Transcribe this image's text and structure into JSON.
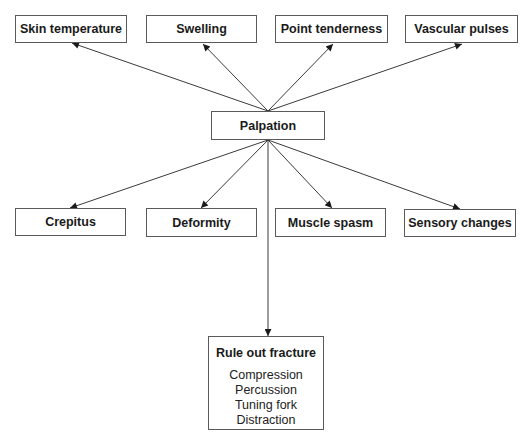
{
  "diagram": {
    "center": {
      "label": "Palpation",
      "box": [
        211,
        111,
        114,
        29
      ]
    },
    "top_nodes": [
      {
        "label": "Skin temperature",
        "box": [
          15,
          15,
          112,
          28
        ]
      },
      {
        "label": "Swelling",
        "box": [
          146,
          15,
          111,
          28
        ]
      },
      {
        "label": "Point tenderness",
        "box": [
          275,
          15,
          113,
          28
        ]
      },
      {
        "label": "Vascular pulses",
        "box": [
          405,
          15,
          113,
          28
        ]
      }
    ],
    "bottom_nodes": [
      {
        "label": "Crepitus",
        "box": [
          15,
          208,
          111,
          28
        ]
      },
      {
        "label": "Deformity",
        "box": [
          146,
          208,
          111,
          29
        ]
      },
      {
        "label": "Muscle spasm",
        "box": [
          275,
          208,
          111,
          29
        ]
      },
      {
        "label": "Sensory changes",
        "box": [
          404,
          209,
          112,
          28
        ]
      }
    ],
    "fracture_node": {
      "title": "Rule out fracture",
      "items": [
        "Compression",
        "Percussion",
        "Tuning fork",
        "Distraction"
      ],
      "box": [
        208,
        336,
        116,
        94
      ]
    },
    "edges": [
      {
        "from": "Palpation",
        "to": "Skin temperature"
      },
      {
        "from": "Palpation",
        "to": "Swelling"
      },
      {
        "from": "Palpation",
        "to": "Point tenderness"
      },
      {
        "from": "Palpation",
        "to": "Vascular pulses"
      },
      {
        "from": "Palpation",
        "to": "Crepitus"
      },
      {
        "from": "Palpation",
        "to": "Deformity"
      },
      {
        "from": "Palpation",
        "to": "Muscle spasm"
      },
      {
        "from": "Palpation",
        "to": "Sensory changes"
      },
      {
        "from": "Palpation",
        "to": "Rule out fracture"
      }
    ],
    "colors": {
      "line": "#3a3a3a",
      "border": "#5a5a5a",
      "text": "#1a1a1a"
    }
  }
}
